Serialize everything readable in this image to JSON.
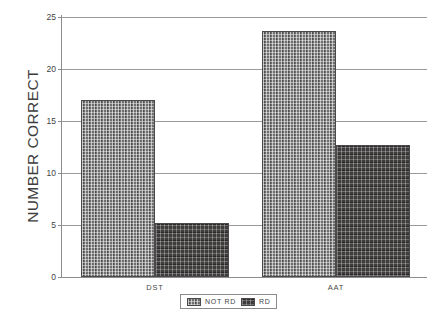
{
  "chart_data": {
    "type": "bar",
    "title": "",
    "xlabel": "",
    "ylabel": "NUMBER CORRECT",
    "categories": [
      "DST",
      "AAT"
    ],
    "series": [
      {
        "name": "NOT RD",
        "values": [
          17,
          23.7
        ],
        "color": "#6f6f6f",
        "pattern": "light-checker-halftone"
      },
      {
        "name": "RD",
        "values": [
          5.2,
          12.7
        ],
        "color": "#3f3c3c",
        "pattern": "dark-dense-dither"
      }
    ],
    "ylim": [
      0,
      25
    ],
    "yticks": [
      0,
      5,
      10,
      15,
      20,
      25
    ],
    "ytick_labels": [
      "0",
      "5",
      "10",
      "15",
      "20",
      "25"
    ],
    "grid": true,
    "grid_axis": "y",
    "legend_position": "bottom-center",
    "bar_gap_between_groups": true
  },
  "axes": {
    "y_title": "NUMBER CORRECT",
    "y_ticks": [
      {
        "label": "25",
        "value": 25
      },
      {
        "label": "20",
        "value": 20
      },
      {
        "label": "15",
        "value": 15
      },
      {
        "label": "10",
        "value": 10
      },
      {
        "label": "5",
        "value": 5
      },
      {
        "label": "0",
        "value": 0
      }
    ],
    "x_ticks": [
      {
        "label": "DST"
      },
      {
        "label": "AAT"
      }
    ]
  },
  "legend": {
    "entries": [
      {
        "label": "NOT RD"
      },
      {
        "label": "RD"
      }
    ]
  }
}
